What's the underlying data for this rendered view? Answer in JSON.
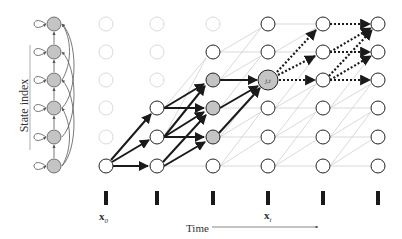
{
  "diagram": {
    "type": "HMM trellis / Viterbi lattice",
    "y_axis_label": "State index",
    "x_axis_label": "Time",
    "observation_labels": {
      "first": {
        "base": "x",
        "sub": "0"
      },
      "current": {
        "base": "x",
        "sub": "t"
      }
    },
    "highlight_node_label": "j,t",
    "columns_x": [
      106,
      157,
      213,
      268,
      323,
      378
    ],
    "rows_y": [
      24,
      52,
      80,
      108,
      137,
      166
    ],
    "colors": {
      "faded_node": "#d8d8d8",
      "active_node_stroke": "#222222",
      "shaded_fill": "#c4c4c4",
      "faint_edge": "#c8c8c8",
      "bold_edge": "#1a1a1a"
    }
  }
}
